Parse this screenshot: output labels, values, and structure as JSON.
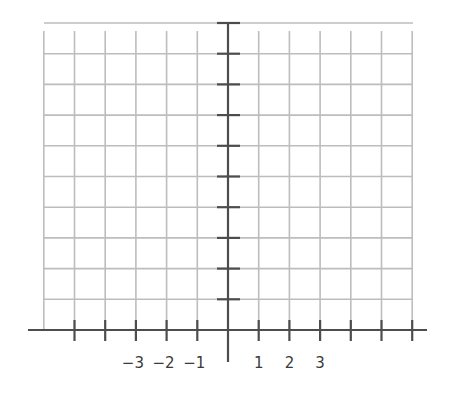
{
  "diagram": {
    "type": "coordinate-grid",
    "grid": {
      "columns_left_of_y_axis": 6,
      "columns_right_of_y_axis": 6,
      "rows_above_x_axis": 10,
      "left_px": 44,
      "right_px": 413,
      "top_px": 31,
      "bottom_px": 330,
      "origin_x_px": 228,
      "origin_y_px": 330,
      "cell_px": 30.7
    },
    "axes": {
      "x_axis": {
        "from_px": 28,
        "to_px": 427,
        "y_px": 330
      },
      "y_axis": {
        "x_px": 228,
        "from_px": 22,
        "to_px": 362
      },
      "x_ticks": [
        -5,
        -4,
        -3,
        -2,
        -1,
        1,
        2,
        3,
        4,
        5,
        6
      ],
      "y_ticks": [
        1,
        2,
        3,
        4,
        5,
        6,
        7,
        8,
        9,
        10
      ]
    },
    "x_tick_labels": [
      {
        "value": -3,
        "text": "−3"
      },
      {
        "value": -2,
        "text": "−2"
      },
      {
        "value": -1,
        "text": "−1"
      },
      {
        "value": 1,
        "text": "1"
      },
      {
        "value": 2,
        "text": "2"
      },
      {
        "value": 3,
        "text": "3"
      }
    ],
    "colors": {
      "grid": "#bdbdbd",
      "axis": "#4d4d4d",
      "label": "#3a3a3a",
      "background": "#ffffff"
    }
  }
}
